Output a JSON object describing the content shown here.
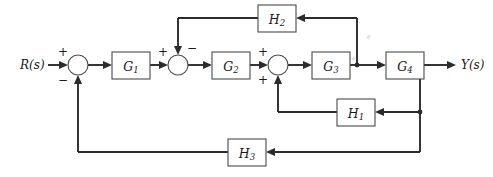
{
  "diagram": {
    "type": "control-block-diagram",
    "background_color": "#ffffff",
    "line_color": "#2b2b2b",
    "box_stroke_color": "#4a4a4a",
    "box_fill_color": "#ffffff",
    "input": {
      "label": "R(s)",
      "x": 22,
      "y": 65
    },
    "output": {
      "label": "Y(s)",
      "x": 462,
      "y": 65
    },
    "blocks": [
      {
        "id": "G1",
        "base": "G",
        "sub": "1",
        "x": 112,
        "y": 52,
        "w": 38,
        "h": 27
      },
      {
        "id": "G2",
        "base": "G",
        "sub": "2",
        "x": 212,
        "y": 52,
        "w": 38,
        "h": 27
      },
      {
        "id": "G3",
        "base": "G",
        "sub": "3",
        "x": 312,
        "y": 52,
        "w": 38,
        "h": 27
      },
      {
        "id": "G4",
        "base": "G",
        "sub": "4",
        "x": 386,
        "y": 52,
        "w": 38,
        "h": 27
      },
      {
        "id": "H1",
        "base": "H",
        "sub": "1",
        "x": 337,
        "y": 99,
        "w": 38,
        "h": 27
      },
      {
        "id": "H2",
        "base": "H",
        "sub": "2",
        "x": 258,
        "y": 5,
        "w": 38,
        "h": 27
      },
      {
        "id": "H3",
        "base": "H",
        "sub": "3",
        "x": 228,
        "y": 139,
        "w": 38,
        "h": 27
      }
    ],
    "summing_junctions": [
      {
        "id": "sum1",
        "cx": 78,
        "cy": 65,
        "r": 10,
        "signs": [
          {
            "text": "+",
            "x": 63,
            "y": 52,
            "input": "left"
          },
          {
            "text": "−",
            "x": 63,
            "y": 80,
            "input": "bottom"
          }
        ]
      },
      {
        "id": "sum2",
        "cx": 178,
        "cy": 65,
        "r": 10,
        "signs": [
          {
            "text": "+",
            "x": 163,
            "y": 52,
            "input": "left"
          },
          {
            "text": "−",
            "x": 192,
            "y": 48,
            "input": "top"
          }
        ]
      },
      {
        "id": "sum3",
        "cx": 278,
        "cy": 65,
        "r": 10,
        "signs": [
          {
            "text": "+",
            "x": 263,
            "y": 52,
            "input": "left"
          },
          {
            "text": "+",
            "x": 263,
            "y": 80,
            "input": "bottom"
          }
        ]
      }
    ],
    "nodes": [
      {
        "id": "nodeA",
        "x": 357,
        "y": 65,
        "label": "G3-output-takeoff"
      },
      {
        "id": "nodeB",
        "x": 420,
        "y": 65,
        "label": "G4-output-takeoff"
      }
    ],
    "signal_paths": [
      {
        "id": "forward",
        "from": "R(s)",
        "to": "Y(s)",
        "elements": [
          "sum1",
          "G1",
          "sum2",
          "G2",
          "sum3",
          "G3",
          "G4"
        ]
      },
      {
        "id": "h2-loop",
        "from": "nodeA",
        "to": "sum2",
        "through": "H2",
        "sign": "−"
      },
      {
        "id": "h1-loop",
        "from": "nodeB",
        "to": "sum3",
        "through": "H1",
        "sign": "+"
      },
      {
        "id": "h3-loop",
        "from": "nodeB",
        "to": "sum1",
        "through": "H3",
        "sign": "−"
      }
    ],
    "artifacts": [
      {
        "id": "smudge-1",
        "text": "✦",
        "x": 352,
        "y": 60
      },
      {
        "id": "smudge-2",
        "text": "✦",
        "x": 369,
        "y": 40
      }
    ]
  }
}
